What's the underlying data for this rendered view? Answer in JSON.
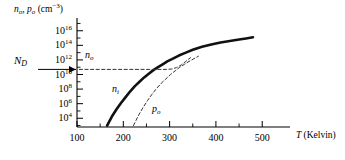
{
  "chart_data": {
    "type": "line",
    "title": "",
    "subtitle": "",
    "xlabel": "T (Kelvin)",
    "ylabel": "n_o, p_o (cm^-3)",
    "xlabel_parts": {
      "symbol": "T",
      "unit": "(Kelvin)"
    },
    "ylabel_parts": {
      "sym1": "n",
      "sub1": "o",
      "sep": ", ",
      "sym2": "p",
      "sub2": "o",
      "unit_open": " (cm",
      "unit_exp": "−3",
      "unit_close": ")"
    },
    "xlim": [
      100,
      560
    ],
    "ylim_log10": [
      2.8,
      17.2
    ],
    "xticks": [
      100,
      200,
      300,
      400,
      500
    ],
    "xtick_labels": [
      "100",
      "200",
      "300",
      "400",
      "500"
    ],
    "x_minor_ticks": [
      150,
      250,
      350,
      450
    ],
    "yticks_log10": [
      4,
      6,
      8,
      10,
      12,
      14,
      16
    ],
    "ytick_labels": [
      "10",
      "10",
      "10",
      "10",
      "10",
      "10",
      "10"
    ],
    "ytick_exponents": [
      "4",
      "6",
      "8",
      "10",
      "12",
      "14",
      "16"
    ],
    "y_minor_ticks_log10": [
      5,
      7,
      9,
      11,
      13,
      15,
      17
    ],
    "grid": false,
    "legend": "inline-labels",
    "legend_position": "inline",
    "annotations": [
      {
        "name": "N_D",
        "symbol": "N",
        "sub": "D",
        "kind": "axis-arrow-label",
        "value_log10": 10.7
      },
      {
        "name": "n_o",
        "symbol": "n",
        "sub": "o",
        "kind": "curve-label"
      },
      {
        "name": "n_i",
        "symbol": "n",
        "sub": "i",
        "kind": "curve-label"
      },
      {
        "name": "p_o",
        "symbol": "p",
        "sub": "o",
        "kind": "curve-label"
      }
    ],
    "series": [
      {
        "name": "n_i",
        "style": "solid",
        "linewidth": 2.6,
        "color": "#111111",
        "points": [
          [
            165,
            3.0
          ],
          [
            175,
            4.2
          ],
          [
            185,
            5.2
          ],
          [
            195,
            6.1
          ],
          [
            205,
            6.9
          ],
          [
            215,
            7.7
          ],
          [
            225,
            8.4
          ],
          [
            235,
            9.0
          ],
          [
            245,
            9.6
          ],
          [
            255,
            10.1
          ],
          [
            265,
            10.6
          ],
          [
            275,
            11.0
          ],
          [
            285,
            11.4
          ],
          [
            295,
            11.8
          ],
          [
            305,
            12.1
          ],
          [
            320,
            12.6
          ],
          [
            335,
            13.0
          ],
          [
            350,
            13.4
          ],
          [
            370,
            13.8
          ],
          [
            390,
            14.1
          ],
          [
            410,
            14.4
          ],
          [
            430,
            14.6
          ],
          [
            450,
            14.8
          ],
          [
            465,
            14.95
          ],
          [
            480,
            15.1
          ]
        ]
      },
      {
        "name": "n_o",
        "style": "dashed",
        "linewidth": 1.0,
        "color": "#333333",
        "points": [
          [
            105,
            10.7
          ],
          [
            150,
            10.7
          ],
          [
            200,
            10.7
          ],
          [
            250,
            10.7
          ],
          [
            290,
            10.7
          ],
          [
            305,
            10.75
          ],
          [
            315,
            10.95
          ],
          [
            325,
            11.3
          ],
          [
            335,
            11.8
          ],
          [
            345,
            12.3
          ]
        ]
      },
      {
        "name": "p_o",
        "style": "dashed",
        "linewidth": 1.0,
        "color": "#333333",
        "points": [
          [
            222,
            3.0
          ],
          [
            232,
            4.3
          ],
          [
            242,
            5.4
          ],
          [
            252,
            6.4
          ],
          [
            262,
            7.3
          ],
          [
            272,
            8.1
          ],
          [
            282,
            8.8
          ],
          [
            292,
            9.4
          ],
          [
            302,
            10.0
          ],
          [
            312,
            10.5
          ],
          [
            322,
            11.0
          ],
          [
            332,
            11.4
          ],
          [
            342,
            11.8
          ],
          [
            352,
            12.15
          ],
          [
            362,
            12.5
          ]
        ]
      }
    ]
  }
}
